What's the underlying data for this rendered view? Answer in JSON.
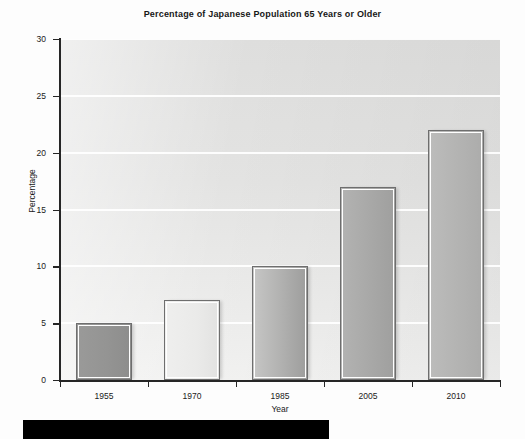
{
  "chart_data": {
    "type": "bar",
    "title": "Percentage of Japanese Population 65 Years or Older",
    "xlabel": "Year",
    "ylabel": "Percentage",
    "categories": [
      "1955",
      "1970",
      "1985",
      "2005",
      "2010"
    ],
    "values": [
      5,
      7,
      10,
      17,
      22
    ],
    "ylim": [
      0,
      30
    ],
    "ytick_labels": [
      "0",
      "5",
      "10",
      "15",
      "20",
      "25",
      "30"
    ],
    "ytick_values": [
      0,
      5,
      10,
      15,
      20,
      25,
      30
    ],
    "grid": "horizontal",
    "legend": "none",
    "bar_tones": [
      "tone-dark",
      "tone-light",
      "tone-grad",
      "tone-mid",
      "tone-midlt"
    ],
    "plot_background_color": "#e3e3e2",
    "gridline_color": "#ffffff",
    "bar_border_color": "#6e6e6e",
    "axis_color": "#262626"
  },
  "artifacts": {
    "bottom_band_color": "#000000"
  }
}
